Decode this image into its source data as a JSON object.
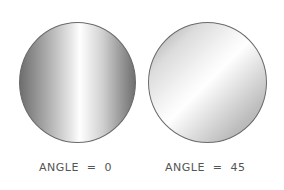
{
  "figures": [
    {
      "label": "ANGLE  =  0",
      "gradient_angle": 0
    },
    {
      "label": "ANGLE  =  45",
      "gradient_angle": 45
    }
  ]
}
